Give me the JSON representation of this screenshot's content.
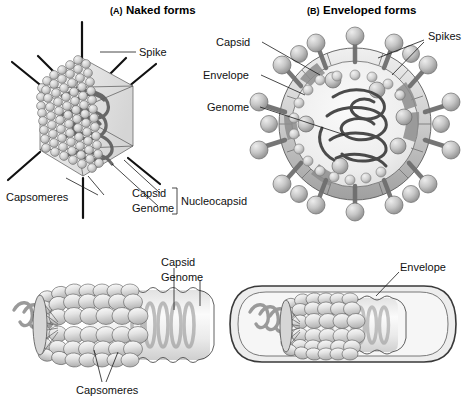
{
  "figure": {
    "background": "#ffffff"
  },
  "panels": [
    {
      "id": "A",
      "paren": "(A)",
      "heading": "Naked forms",
      "labels": [
        {
          "name": "spike",
          "text": "Spike"
        },
        {
          "name": "capsomeres",
          "text": "Capsomeres"
        },
        {
          "name": "capsid",
          "text": "Capsid"
        },
        {
          "name": "genome",
          "text": "Genome"
        },
        {
          "name": "nucleocapsid",
          "text": "Nucleocapsid"
        }
      ]
    },
    {
      "id": "B",
      "paren": "(B)",
      "heading": "Enveloped forms",
      "labels": [
        {
          "name": "capsid",
          "text": "Capsid"
        },
        {
          "name": "envelope",
          "text": "Envelope"
        },
        {
          "name": "genome",
          "text": "Genome"
        },
        {
          "name": "spikes",
          "text": "Spikes"
        }
      ]
    }
  ],
  "bottom_left": {
    "name": "helical-naked-virus",
    "labels": [
      {
        "name": "capsid",
        "text": "Capsid"
      },
      {
        "name": "genome",
        "text": "Genome"
      },
      {
        "name": "capsomeres",
        "text": "Capsomeres"
      }
    ]
  },
  "bottom_right": {
    "name": "helical-enveloped-virus",
    "labels": [
      {
        "name": "envelope",
        "text": "Envelope"
      }
    ]
  },
  "colors": {
    "line": "#1a1a1a",
    "capsomere_fill": "#d8d8d8",
    "capsomere_edge": "#6b6b6b",
    "genome_stroke": "#5e5e5e",
    "envelope_light": "#cfcfcf",
    "envelope_dark": "#8a8a8a",
    "spike_knob": "#bdbdbd",
    "body_fill": "#ececec"
  }
}
